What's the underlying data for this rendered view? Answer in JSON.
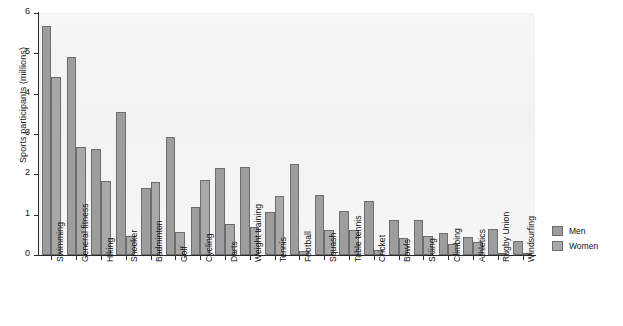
{
  "chart_data": {
    "type": "bar",
    "title": "",
    "xlabel": "",
    "ylabel": "Sports participants (millions)",
    "ylim": [
      0,
      6
    ],
    "yticks": [
      0,
      1,
      2,
      3,
      4,
      5,
      6
    ],
    "ytick_labels": [
      "0",
      "1",
      "2",
      "3",
      "4",
      "5",
      "6"
    ],
    "grid": false,
    "legend_position": "right",
    "categories": [
      "Swimming",
      "General fitness",
      "Hiking",
      "Snooker",
      "Badminton",
      "Golf",
      "Cycling",
      "Darts",
      "Weight training",
      "Tennis",
      "Football",
      "Squash",
      "Table tennis",
      "Cricket",
      "Bowls",
      "Skiing",
      "Climbing",
      "Athletics",
      "Rugby Union",
      "Windsurfing"
    ],
    "series": [
      {
        "name": "Men",
        "color": "#9d9d9d",
        "values": [
          5.68,
          4.9,
          2.62,
          3.55,
          1.65,
          2.92,
          1.18,
          2.15,
          2.17,
          1.07,
          2.25,
          1.48,
          1.08,
          1.35,
          0.87,
          0.86,
          0.55,
          0.45,
          0.64,
          0.35
        ]
      },
      {
        "name": "Women",
        "color": "#a8a8a8",
        "values": [
          4.42,
          2.67,
          1.83,
          0.47,
          1.8,
          0.57,
          1.85,
          0.77,
          0.69,
          1.47,
          0.1,
          0.63,
          0.62,
          0.13,
          0.42,
          0.48,
          0.27,
          0.33,
          0.05,
          0.02
        ]
      }
    ]
  },
  "legend": {
    "items": [
      {
        "label": "Men"
      },
      {
        "label": "Women"
      }
    ]
  }
}
